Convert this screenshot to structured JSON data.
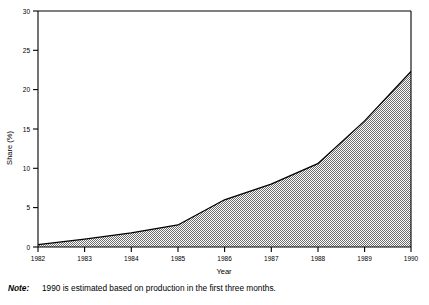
{
  "chart_data": {
    "type": "area",
    "title": "",
    "subtitle": "",
    "xlabel": "Year",
    "ylabel": "Share (%)",
    "x": [
      1982,
      1983,
      1984,
      1985,
      1986,
      1987,
      1988,
      1989,
      1990
    ],
    "categories": [
      "1982",
      "1983",
      "1984",
      "1985",
      "1986",
      "1987",
      "1988",
      "1989",
      "1990"
    ],
    "values": [
      0.3,
      1.0,
      1.8,
      2.8,
      6.0,
      8.0,
      10.6,
      16.0,
      22.3
    ],
    "series": [
      {
        "name": "Share (%)",
        "values": [
          0.3,
          1.0,
          1.8,
          2.8,
          6.0,
          8.0,
          10.6,
          16.0,
          22.3
        ]
      }
    ],
    "xlim": [
      1982,
      1990
    ],
    "ylim": [
      0,
      30
    ],
    "ytick_labels": [
      "0",
      "5",
      "10",
      "15",
      "20",
      "25",
      "30"
    ],
    "ytick_values": [
      0,
      5,
      10,
      15,
      20,
      25,
      30
    ],
    "xtick_labels": [
      "1982",
      "1983",
      "1984",
      "1985",
      "1986",
      "1987",
      "1988",
      "1989",
      "1990"
    ],
    "grid": false,
    "legend": "none",
    "fill_style": "50% gray checkerboard hatch",
    "line_color": "#000000",
    "fill_color": "#999999",
    "axis_color": "#000000",
    "background": "#ffffff"
  },
  "axes": {
    "y_title": "Share (%)",
    "x_title": "Year",
    "y_ticks": [
      "30",
      "25",
      "20",
      "15",
      "10",
      "5",
      "0"
    ],
    "x_ticks": [
      "1982",
      "1983",
      "1984",
      "1985",
      "1986",
      "1987",
      "1988",
      "1989",
      "1990"
    ]
  },
  "note": {
    "label": "Note:",
    "text": "1990 is estimated based on production in the first three months."
  }
}
